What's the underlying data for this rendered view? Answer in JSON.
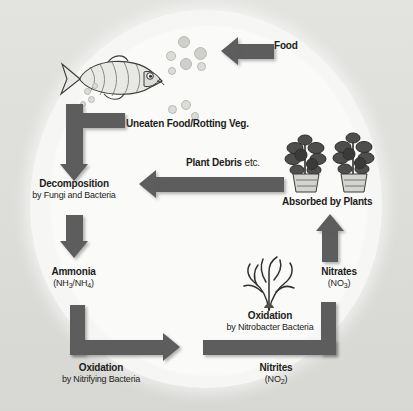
{
  "diagram": {
    "type": "cycle-diagram",
    "colors": {
      "arrow": "#5d5d5d",
      "text": "#1d1d1b",
      "background": "#d9d9d6",
      "circle": "#f6f6f4"
    },
    "nodes": [
      {
        "id": "food",
        "label": "Food",
        "sub": "",
        "icon": "food-arrow-icon"
      },
      {
        "id": "uneaten",
        "label": "Uneaten Food/Rotting Veg.",
        "sub": "",
        "icon": "debris-icon"
      },
      {
        "id": "decomposition",
        "label": "Decomposition",
        "sub": "by Fungi and Bacteria",
        "icon": "decomposition-icon"
      },
      {
        "id": "ammonia",
        "label": "Ammonia",
        "sub": "(NH3/NH4)",
        "sub_prefix": "(NH",
        "sub_a": "3",
        "sub_mid": "/NH",
        "sub_b": "4",
        "sub_suffix": ")",
        "icon": "ammonia-icon"
      },
      {
        "id": "oxidation_nitrifying",
        "label": "Oxidation",
        "sub": "by Nitrifying Bacteria",
        "icon": "oxidation-icon"
      },
      {
        "id": "nitrites",
        "label": "Nitrites",
        "sub": "(NO2)",
        "sub_prefix": "(NO",
        "sub_a": "2",
        "sub_suffix": ")",
        "icon": "nitrite-icon"
      },
      {
        "id": "oxidation_nitrobacter",
        "label": "Oxidation",
        "sub": "by Nitrobacter Bacteria",
        "icon": "oxidation-icon"
      },
      {
        "id": "nitrates",
        "label": "Nitrates",
        "sub": "(NO3)",
        "sub_prefix": "(NO",
        "sub_a": "3",
        "sub_suffix": ")",
        "icon": "nitrate-icon"
      },
      {
        "id": "absorbed",
        "label": "Absorbed by Plants",
        "sub": "",
        "icon": "plants-icon"
      },
      {
        "id": "plant_debris",
        "label": "Plant Debris",
        "label_regular": "etc.",
        "sub": "",
        "icon": "plant-debris-icon"
      }
    ],
    "illustrations": [
      {
        "id": "fish",
        "name": "fish-illustration"
      },
      {
        "id": "plants",
        "name": "tomato-plants-illustration"
      },
      {
        "id": "algae",
        "name": "algae-illustration"
      },
      {
        "id": "food-pellets",
        "name": "food-pellets-illustration"
      }
    ],
    "arrows": [
      {
        "id": "a-food",
        "direction": "left",
        "from": "food",
        "to": "fish"
      },
      {
        "id": "a-fish-decomp",
        "direction": "down",
        "from": "fish",
        "to": "decomposition"
      },
      {
        "id": "a-uneaten",
        "direction": "left-down",
        "from": "uneaten",
        "to": "decomposition"
      },
      {
        "id": "a-decomp-ammonia",
        "direction": "down",
        "from": "decomposition",
        "to": "ammonia"
      },
      {
        "id": "a-ammonia-nitrite",
        "direction": "down-right",
        "from": "ammonia",
        "to": "nitrites"
      },
      {
        "id": "a-nitrite-nitrate",
        "direction": "right-up",
        "from": "nitrites",
        "to": "nitrates"
      },
      {
        "id": "a-nitrate-plants",
        "direction": "up",
        "from": "nitrates",
        "to": "absorbed"
      },
      {
        "id": "a-plants-decomp",
        "direction": "left",
        "from": "absorbed",
        "to": "decomposition"
      }
    ]
  }
}
